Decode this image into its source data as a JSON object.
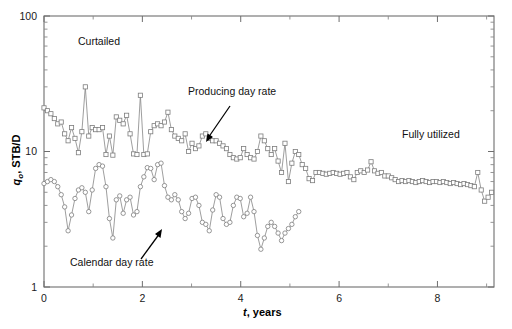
{
  "figure": {
    "background_color": "#ffffff",
    "frame_color": "#6e6e6e",
    "series_color": "#8d8d8d"
  },
  "axes": {
    "x": {
      "label_symbol": "t",
      "label_rest": ", years",
      "min": 0,
      "max": 9.15,
      "major_ticks": [
        0,
        2,
        4,
        6,
        8
      ],
      "minor_ticks": [
        1,
        3,
        5,
        7,
        9
      ],
      "tick_labels": [
        "0",
        "2",
        "4",
        "6",
        "8"
      ],
      "scale": "linear"
    },
    "y": {
      "label_symbol": "q",
      "label_subscript": "o",
      "label_rest": ", STB/D",
      "min": 1,
      "max": 100,
      "major_ticks": [
        1,
        10,
        100
      ],
      "tick_labels": [
        "1",
        "10",
        "100"
      ],
      "scale": "log"
    }
  },
  "annotations": [
    {
      "name": "curtailed",
      "text": "Curtailed",
      "x": 78,
      "y": 45
    },
    {
      "name": "fully-utilized",
      "text": "Fully utilized",
      "x": 402,
      "y": 138
    },
    {
      "name": "producing-day-rate",
      "text": "Producing day rate",
      "x": 188,
      "y": 95
    },
    {
      "name": "calendar-day-rate",
      "text": "Calendar day rate",
      "x": 70,
      "y": 266
    }
  ],
  "chart_data": {
    "type": "line",
    "title": "",
    "xlabel": "t, years",
    "ylabel": "qo, STB/D",
    "xlim": [
      0,
      9.15
    ],
    "ylim": [
      1,
      100
    ],
    "yscale": "log",
    "grid": false,
    "legend": "none",
    "regions": [
      {
        "label": "Curtailed",
        "x_range": [
          0,
          5.2
        ]
      },
      {
        "label": "Fully utilized",
        "x_range": [
          5.2,
          9.15
        ]
      }
    ],
    "series": [
      {
        "name": "Producing day rate",
        "marker": "square",
        "x": [
          0.0,
          0.07,
          0.14,
          0.21,
          0.28,
          0.35,
          0.42,
          0.49,
          0.56,
          0.63,
          0.7,
          0.77,
          0.84,
          0.91,
          0.98,
          1.05,
          1.12,
          1.19,
          1.26,
          1.33,
          1.4,
          1.47,
          1.54,
          1.61,
          1.68,
          1.75,
          1.82,
          1.89,
          1.96,
          2.03,
          2.1,
          2.17,
          2.24,
          2.31,
          2.38,
          2.45,
          2.52,
          2.59,
          2.66,
          2.73,
          2.8,
          2.87,
          2.94,
          3.01,
          3.08,
          3.15,
          3.22,
          3.29,
          3.36,
          3.43,
          3.5,
          3.57,
          3.64,
          3.71,
          3.78,
          3.85,
          3.92,
          3.99,
          4.06,
          4.13,
          4.2,
          4.27,
          4.34,
          4.41,
          4.48,
          4.55,
          4.62,
          4.69,
          4.76,
          4.83,
          4.9,
          4.97,
          5.04,
          5.11,
          5.18,
          5.25,
          5.32,
          5.39,
          5.46,
          5.53,
          5.6,
          5.67,
          5.74,
          5.81,
          5.88,
          5.95,
          6.02,
          6.09,
          6.16,
          6.23,
          6.3,
          6.37,
          6.44,
          6.51,
          6.58,
          6.65,
          6.72,
          6.79,
          6.86,
          6.93,
          7.0,
          7.07,
          7.14,
          7.21,
          7.28,
          7.35,
          7.42,
          7.49,
          7.56,
          7.63,
          7.7,
          7.77,
          7.84,
          7.91,
          7.98,
          8.05,
          8.12,
          8.19,
          8.26,
          8.33,
          8.4,
          8.47,
          8.54,
          8.61,
          8.68,
          8.75,
          8.82,
          8.89,
          8.96,
          9.03,
          9.1
        ],
        "y": [
          21.0,
          20.0,
          19.0,
          17.5,
          16.0,
          16.5,
          13.5,
          12.0,
          15.0,
          12.5,
          9.8,
          14.0,
          30.0,
          13.0,
          15.0,
          14.5,
          14.5,
          15.0,
          9.5,
          13.0,
          9.4,
          18.0,
          17.0,
          16.0,
          18.5,
          13.5,
          9.6,
          9.5,
          26.0,
          9.5,
          9.6,
          14.0,
          15.5,
          16.0,
          15.5,
          16.5,
          19.5,
          14.5,
          13.0,
          12.5,
          12.0,
          13.5,
          10.0,
          11.5,
          10.5,
          11.0,
          13.0,
          13.5,
          12.5,
          12.0,
          12.0,
          11.5,
          11.0,
          10.5,
          9.5,
          9.0,
          8.8,
          9.0,
          10.5,
          9.5,
          9.0,
          8.8,
          10.0,
          13.0,
          12.0,
          10.5,
          9.5,
          10.5,
          8.5,
          7.0,
          11.5,
          6.0,
          8.2,
          10.0,
          9.5,
          8.0,
          7.5,
          6.3,
          6.1,
          7.0,
          7.0,
          6.9,
          6.8,
          6.9,
          7.0,
          6.9,
          6.8,
          6.9,
          7.0,
          6.5,
          6.2,
          7.0,
          7.2,
          7.0,
          7.3,
          8.4,
          7.2,
          6.9,
          7.0,
          6.6,
          6.6,
          6.4,
          6.2,
          6.0,
          6.1,
          6.0,
          6.1,
          6.0,
          5.9,
          6.0,
          6.1,
          6.0,
          5.9,
          6.0,
          6.0,
          5.9,
          6.0,
          5.9,
          5.8,
          5.9,
          5.8,
          5.7,
          5.8,
          5.7,
          5.6,
          5.5,
          7.0,
          5.2,
          4.3,
          4.6,
          5.0
        ]
      },
      {
        "name": "Calendar day rate",
        "marker": "circle",
        "x": [
          0.0,
          0.07,
          0.14,
          0.21,
          0.28,
          0.35,
          0.42,
          0.49,
          0.56,
          0.63,
          0.7,
          0.77,
          0.84,
          0.91,
          0.98,
          1.05,
          1.12,
          1.19,
          1.26,
          1.33,
          1.4,
          1.47,
          1.54,
          1.61,
          1.68,
          1.75,
          1.82,
          1.89,
          1.96,
          2.03,
          2.1,
          2.17,
          2.24,
          2.31,
          2.38,
          2.45,
          2.52,
          2.59,
          2.66,
          2.73,
          2.8,
          2.87,
          2.94,
          3.01,
          3.08,
          3.15,
          3.22,
          3.29,
          3.36,
          3.43,
          3.5,
          3.57,
          3.64,
          3.71,
          3.78,
          3.85,
          3.92,
          3.99,
          4.06,
          4.13,
          4.2,
          4.27,
          4.34,
          4.41,
          4.48,
          4.55,
          4.62,
          4.69,
          4.76,
          4.83,
          4.9,
          4.97,
          5.04,
          5.11,
          5.18
        ],
        "y": [
          5.8,
          6.0,
          6.2,
          6.0,
          5.5,
          4.8,
          3.9,
          2.6,
          3.4,
          4.5,
          5.2,
          5.4,
          5.0,
          3.6,
          5.2,
          7.5,
          8.0,
          7.8,
          5.5,
          3.2,
          2.3,
          4.4,
          4.7,
          3.5,
          4.4,
          4.6,
          3.4,
          3.6,
          5.5,
          6.5,
          7.6,
          7.5,
          6.2,
          8.0,
          8.2,
          5.6,
          4.6,
          4.4,
          4.8,
          4.4,
          3.6,
          3.2,
          3.5,
          4.5,
          4.6,
          4.0,
          3.0,
          2.9,
          2.6,
          3.7,
          4.8,
          4.6,
          3.2,
          2.9,
          3.0,
          4.0,
          4.6,
          4.5,
          3.3,
          3.5,
          4.6,
          3.6,
          2.4,
          1.9,
          2.3,
          2.8,
          3.0,
          2.8,
          2.5,
          2.2,
          2.5,
          2.7,
          2.9,
          3.3,
          3.6
        ]
      }
    ]
  }
}
